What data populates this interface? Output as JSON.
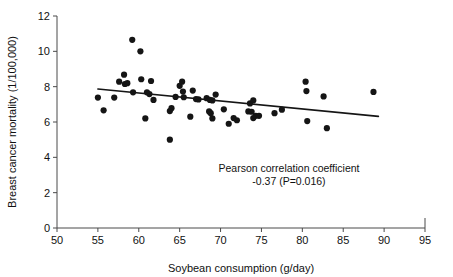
{
  "chart_data": {
    "type": "scatter",
    "title": "",
    "xlabel": "Soybean consumption (g/day)",
    "ylabel": "Breast cancer mortality (1/100,000)",
    "xlim": [
      50,
      95
    ],
    "ylim": [
      0,
      12
    ],
    "xticks": [
      50,
      55,
      60,
      65,
      70,
      75,
      80,
      85,
      90,
      95
    ],
    "yticks": [
      0,
      2,
      4,
      6,
      8,
      10,
      12
    ],
    "grid": false,
    "legend": null,
    "marker_color": "#151515",
    "line_color": "#151515",
    "annotations": [
      {
        "name": "pearson-annotation",
        "line1": "Pearson correlation coefficient",
        "line2": "-0.37 (P=0.016)",
        "x": 74.5,
        "y": 3.2
      }
    ],
    "statistics": {
      "pearson_r": -0.37,
      "p_value": 0.016
    },
    "fit_line": {
      "name": "regression-line",
      "x_start": 55.0,
      "y_start": 7.87,
      "x_end": 89.3,
      "y_end": 6.32
    },
    "points": [
      {
        "x": 55.0,
        "y": 7.38
      },
      {
        "x": 55.7,
        "y": 6.66
      },
      {
        "x": 57.0,
        "y": 7.38
      },
      {
        "x": 57.6,
        "y": 8.28
      },
      {
        "x": 58.2,
        "y": 8.68
      },
      {
        "x": 58.3,
        "y": 8.15
      },
      {
        "x": 58.6,
        "y": 8.2
      },
      {
        "x": 59.2,
        "y": 10.65
      },
      {
        "x": 59.3,
        "y": 7.68
      },
      {
        "x": 60.2,
        "y": 10.0
      },
      {
        "x": 60.3,
        "y": 8.42
      },
      {
        "x": 60.8,
        "y": 6.2
      },
      {
        "x": 61.0,
        "y": 7.68
      },
      {
        "x": 61.3,
        "y": 7.58
      },
      {
        "x": 61.5,
        "y": 8.32
      },
      {
        "x": 61.8,
        "y": 7.25
      },
      {
        "x": 63.8,
        "y": 6.62
      },
      {
        "x": 63.8,
        "y": 5.0
      },
      {
        "x": 64.0,
        "y": 6.78
      },
      {
        "x": 64.5,
        "y": 7.42
      },
      {
        "x": 65.0,
        "y": 8.05
      },
      {
        "x": 65.3,
        "y": 8.28
      },
      {
        "x": 65.4,
        "y": 7.72
      },
      {
        "x": 65.5,
        "y": 7.4
      },
      {
        "x": 66.3,
        "y": 6.3
      },
      {
        "x": 66.6,
        "y": 7.78
      },
      {
        "x": 67.0,
        "y": 7.3
      },
      {
        "x": 67.3,
        "y": 7.28
      },
      {
        "x": 68.3,
        "y": 7.35
      },
      {
        "x": 68.6,
        "y": 6.6
      },
      {
        "x": 68.7,
        "y": 7.25
      },
      {
        "x": 68.8,
        "y": 6.5
      },
      {
        "x": 69.0,
        "y": 7.22
      },
      {
        "x": 69.0,
        "y": 6.2
      },
      {
        "x": 69.4,
        "y": 7.55
      },
      {
        "x": 70.4,
        "y": 6.72
      },
      {
        "x": 71.0,
        "y": 5.9
      },
      {
        "x": 71.6,
        "y": 6.22
      },
      {
        "x": 72.0,
        "y": 6.1
      },
      {
        "x": 73.4,
        "y": 6.6
      },
      {
        "x": 73.6,
        "y": 7.05
      },
      {
        "x": 73.8,
        "y": 6.58
      },
      {
        "x": 74.0,
        "y": 7.22
      },
      {
        "x": 74.0,
        "y": 6.22
      },
      {
        "x": 74.3,
        "y": 6.35
      },
      {
        "x": 74.7,
        "y": 6.35
      },
      {
        "x": 76.6,
        "y": 6.5
      },
      {
        "x": 77.5,
        "y": 6.7
      },
      {
        "x": 80.4,
        "y": 8.28
      },
      {
        "x": 80.5,
        "y": 7.75
      },
      {
        "x": 80.6,
        "y": 6.05
      },
      {
        "x": 82.6,
        "y": 7.45
      },
      {
        "x": 83.0,
        "y": 5.65
      },
      {
        "x": 88.7,
        "y": 7.7
      }
    ]
  }
}
